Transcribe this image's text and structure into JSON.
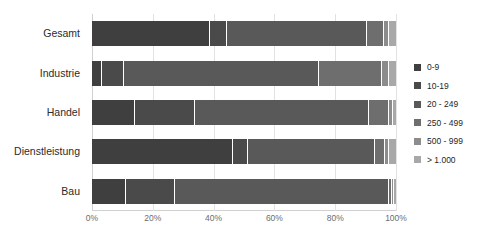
{
  "chart_data": {
    "type": "bar",
    "orientation": "horizontal",
    "stacked": true,
    "stack_mode": "percent",
    "title": "",
    "subtitle": "",
    "xlabel": "",
    "ylabel": "",
    "xlim": [
      0,
      100
    ],
    "x_tick_labels": [
      "0%",
      "20%",
      "40%",
      "60%",
      "80%",
      "100%"
    ],
    "x_tick_values": [
      0,
      20,
      40,
      60,
      80,
      100
    ],
    "grid": true,
    "grid_axis": "x",
    "legend_position": "right",
    "categories": [
      "Gesamt",
      "Industrie",
      "Handel",
      "Dienstleistung",
      "Bau"
    ],
    "series": [
      {
        "name": "0-9",
        "color": "#3f3f3f",
        "values": [
          38.8,
          3.3,
          14.1,
          46.4,
          11.2
        ]
      },
      {
        "name": "10-19",
        "color": "#4a4a4a",
        "values": [
          5.6,
          7.2,
          19.7,
          4.9,
          16.1
        ]
      },
      {
        "name": "20 - 249",
        "color": "#595959",
        "values": [
          46.1,
          64.1,
          57.2,
          41.8,
          70.4
        ]
      },
      {
        "name": "250 - 499",
        "color": "#6e6e6e",
        "values": [
          5.6,
          20.7,
          6.6,
          3.3,
          1.0
        ]
      },
      {
        "name": "500 - 999",
        "color": "#8c8c8c",
        "values": [
          1.6,
          2.3,
          1.3,
          1.3,
          0.6
        ]
      },
      {
        "name": "> 1.000",
        "color": "#a8a8a8",
        "values": [
          2.3,
          2.4,
          1.1,
          2.3,
          0.7
        ]
      }
    ]
  },
  "axes": {
    "x_tick_labels": [
      "0%",
      "20%",
      "40%",
      "60%",
      "80%",
      "100%"
    ]
  },
  "legend": {
    "items": [
      {
        "label": "0-9",
        "color": "#3f3f3f"
      },
      {
        "label": "10-19",
        "color": "#4a4a4a"
      },
      {
        "label": "20 - 249",
        "color": "#595959"
      },
      {
        "label": "250 - 499",
        "color": "#6e6e6e"
      },
      {
        "label": "500 - 999",
        "color": "#8c8c8c"
      },
      {
        "label": "> 1.000",
        "color": "#a8a8a8"
      }
    ]
  },
  "colors": {
    "background": "#ffffff",
    "gridline": "#e2e2e2",
    "axis": "#d0d0d0",
    "category_text": "#2b2b2b",
    "tick_text": "#6d6d6d",
    "legend_text": "#1f1f1f"
  }
}
